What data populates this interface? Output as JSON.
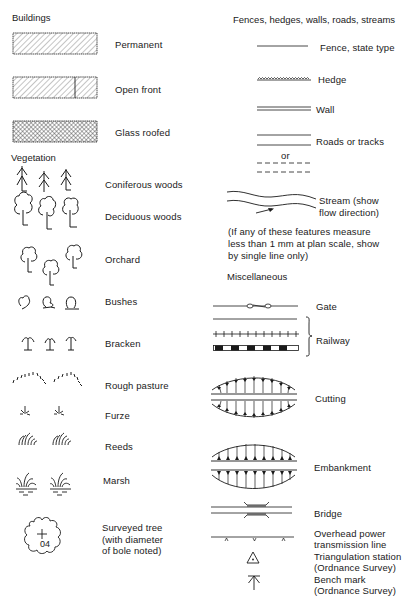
{
  "sections": {
    "buildings": {
      "title": "Buildings",
      "items": [
        {
          "label": "Permanent",
          "symbol": "hatched-rectangle"
        },
        {
          "label": "Open front",
          "symbol": "hatched-rectangle-divided"
        },
        {
          "label": "Glass roofed",
          "symbol": "cross-hatched-rectangle"
        }
      ]
    },
    "vegetation": {
      "title": "Vegetation",
      "items": [
        {
          "label": "Coniferous woods",
          "symbol": "conifer-trees"
        },
        {
          "label": "Deciduous woods",
          "symbol": "deciduous-trees"
        },
        {
          "label": "Orchard",
          "symbol": "orchard-trees"
        },
        {
          "label": "Bushes",
          "symbol": "bushes"
        },
        {
          "label": "Bracken",
          "symbol": "bracken"
        },
        {
          "label": "Rough pasture",
          "symbol": "rough-pasture"
        },
        {
          "label": "Furze",
          "symbol": "furze"
        },
        {
          "label": "Reeds",
          "symbol": "reeds"
        },
        {
          "label": "Marsh",
          "symbol": "marsh"
        },
        {
          "label": "Surveyed tree\n(with diameter\nof bole noted)",
          "symbol": "surveyed-tree",
          "tree_value": "04"
        }
      ]
    },
    "fences": {
      "title": "Fences, hedges, walls, roads, streams",
      "items": [
        {
          "label": "Fence, state type",
          "symbol": "single-line"
        },
        {
          "label": "Hedge",
          "symbol": "wavy-line"
        },
        {
          "label": "Wall",
          "symbol": "double-line"
        },
        {
          "label": "Roads or tracks",
          "symbol": "parallel-lines",
          "alt_label": "or"
        },
        {
          "label": "Stream (show\nflow direction)",
          "symbol": "stream"
        }
      ],
      "note": "(If any of these features measure\nless than 1 mm at plan scale, show\nby single line only)"
    },
    "miscellaneous": {
      "title": "Miscellaneous",
      "items": [
        {
          "label": "Gate",
          "symbol": "gate-line"
        },
        {
          "label": "Railway",
          "symbol": "railway-lines"
        },
        {
          "label": "Cutting",
          "symbol": "cutting"
        },
        {
          "label": "Embankment",
          "symbol": "embankment"
        },
        {
          "label": "Bridge",
          "symbol": "bridge"
        },
        {
          "label": "Overhead power\ntransmission line",
          "symbol": "power-line"
        },
        {
          "label": "Triangulation station\n(Ordnance Survey)",
          "symbol": "triangle-dot"
        },
        {
          "label": "Bench mark\n(Ordnance Survey)",
          "symbol": "bench-mark-arrow"
        }
      ]
    }
  },
  "colors": {
    "ink": "#1a1a1a",
    "background": "#ffffff"
  }
}
